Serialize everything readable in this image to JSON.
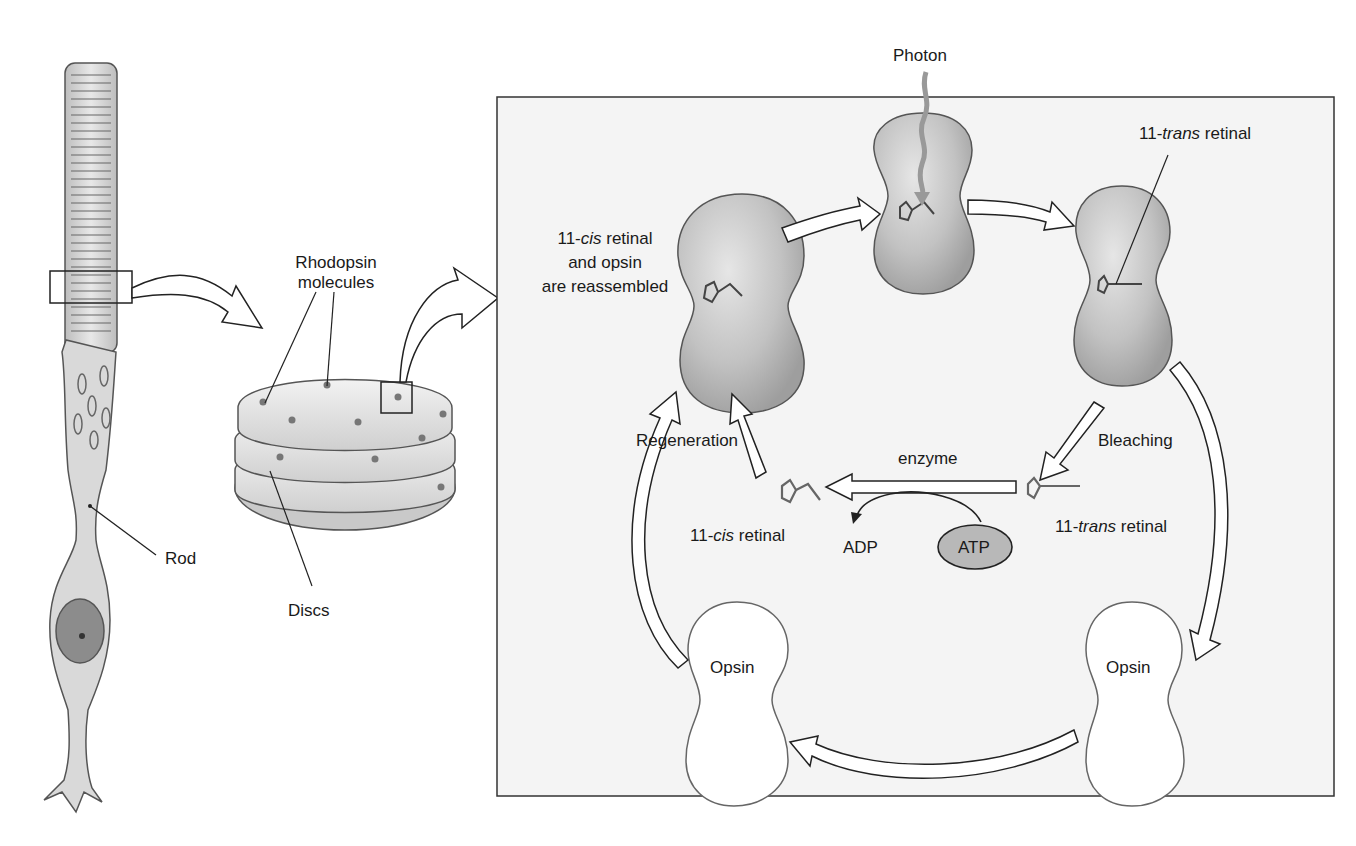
{
  "diagram": {
    "panels": {
      "rod_cell": {
        "label": "Rod"
      },
      "disc_stack": {
        "label_molecules_line1": "Rhodopsin",
        "label_molecules_line2": "molecules",
        "label_discs": "Discs"
      },
      "cycle_box": {
        "photon_label": "Photon",
        "reassembled": {
          "line1_prefix": "11-",
          "line1_italic": "cis",
          "line1_suffix": " retinal",
          "line2": "and opsin",
          "line3": "are reassembled"
        },
        "trans_top": {
          "prefix": "11-",
          "italic": "trans",
          "suffix": " retinal"
        },
        "regeneration_label": "Regeneration",
        "bleaching_label": "Bleaching",
        "enzyme_label": "enzyme",
        "cis_retinal": {
          "prefix": "11-",
          "italic": "cis",
          "suffix": " retinal"
        },
        "trans_retinal": {
          "prefix": "11-",
          "italic": "trans",
          "suffix": " retinal"
        },
        "adp_label": "ADP",
        "atp_label": "ATP",
        "opsin_left_label": "Opsin",
        "opsin_right_label": "Opsin"
      }
    },
    "colors": {
      "molecule_fill": "#bdbdbd",
      "box_fill": "#f4f4f4",
      "line": "#2a2a2a",
      "atp_fill": "#b8b8b8"
    }
  }
}
